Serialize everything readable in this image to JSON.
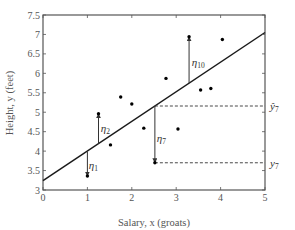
{
  "chart_data": {
    "type": "scatter",
    "title": "",
    "xlabel": "Salary,  x (groats)",
    "ylabel": "Height,  y (feet)",
    "xlim": [
      0,
      5
    ],
    "ylim": [
      3,
      7.5
    ],
    "xticks": [
      0,
      1,
      2,
      3,
      4,
      5
    ],
    "yticks": [
      3,
      3.5,
      4,
      4.5,
      5,
      5.5,
      6,
      6.5,
      7,
      7.5
    ],
    "xtick_labels": [
      "0",
      "1",
      "2",
      "3",
      "4",
      "5"
    ],
    "ytick_labels": [
      "3",
      "3.5",
      "4",
      "4.5",
      "5",
      "5.5",
      "6",
      "6.5",
      "7",
      "7.5"
    ],
    "grid": false,
    "series": [
      {
        "name": "observations",
        "type": "scatter",
        "points": [
          {
            "x": 1.0,
            "y": 3.36
          },
          {
            "x": 1.25,
            "y": 4.96
          },
          {
            "x": 1.52,
            "y": 4.16
          },
          {
            "x": 1.75,
            "y": 5.39
          },
          {
            "x": 2.0,
            "y": 5.21
          },
          {
            "x": 2.27,
            "y": 4.59
          },
          {
            "x": 2.52,
            "y": 3.7
          },
          {
            "x": 2.77,
            "y": 5.87
          },
          {
            "x": 3.04,
            "y": 4.57
          },
          {
            "x": 3.29,
            "y": 6.94
          },
          {
            "x": 3.55,
            "y": 5.57
          },
          {
            "x": 3.78,
            "y": 5.61
          },
          {
            "x": 4.04,
            "y": 6.87
          }
        ]
      },
      {
        "name": "regression line",
        "type": "line",
        "intercept": 3.24,
        "slope": 0.762,
        "x": [
          0,
          5
        ],
        "y": [
          3.24,
          7.05
        ]
      }
    ],
    "residuals": [
      {
        "label": "η",
        "sub": "1",
        "x": 1.0,
        "y_point": 3.36,
        "y_fit": 3.99,
        "label_x": 1.03,
        "label_y": 3.65
      },
      {
        "label": "η",
        "sub": "2",
        "x": 1.25,
        "y_point": 4.96,
        "y_fit": 4.19,
        "label_x": 1.3,
        "label_y": 4.6
      },
      {
        "label": "η",
        "sub": "7",
        "x": 2.52,
        "y_point": 3.7,
        "y_fit": 5.16,
        "label_x": 2.56,
        "label_y": 4.35
      },
      {
        "label": "η",
        "sub": "10",
        "x": 3.29,
        "y_point": 6.94,
        "y_fit": 5.75,
        "label_x": 3.35,
        "label_y": 6.3
      }
    ],
    "annotations": [
      {
        "text": "ŷ",
        "sub": "7",
        "y": 5.16,
        "dashed_from_x": 2.52
      },
      {
        "text": "y",
        "sub": "7",
        "y": 3.7,
        "dashed_from_x": 2.52
      }
    ]
  },
  "colors": {
    "axis": "#555555",
    "line": "#1a1a1a",
    "points": "#000000",
    "residual": "#333333",
    "dashed": "#333333"
  }
}
